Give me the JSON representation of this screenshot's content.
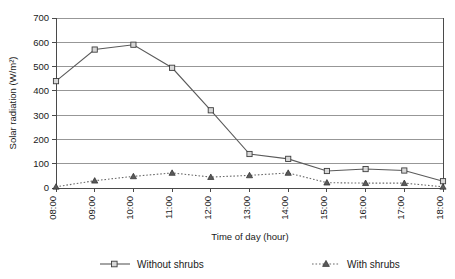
{
  "chart_data": {
    "type": "line",
    "title": "",
    "xlabel": "Time of day (hour)",
    "ylabel": "Solar radiation (W/m²)",
    "categories": [
      "08:00",
      "09:00",
      "10:00",
      "11:00",
      "12:00",
      "13:00",
      "14:00",
      "15:00",
      "16:00",
      "17:00",
      "18:00"
    ],
    "series": [
      {
        "name": "Without shrubs",
        "marker": "square",
        "line_style": "solid",
        "values": [
          440,
          570,
          590,
          495,
          320,
          140,
          120,
          70,
          78,
          72,
          28
        ]
      },
      {
        "name": "With shrubs",
        "marker": "triangle",
        "line_style": "dotted",
        "values": [
          5,
          30,
          48,
          62,
          45,
          52,
          62,
          22,
          20,
          20,
          5
        ]
      }
    ],
    "ylim": [
      0,
      700
    ],
    "y_ticks": [
      0,
      100,
      200,
      300,
      400,
      500,
      600,
      700
    ],
    "y_tick_labels": [
      "0",
      "100",
      "200",
      "300",
      "400",
      "500",
      "600",
      "700"
    ],
    "grid": "horizontal",
    "legend_position": "bottom",
    "colors": {
      "series_without_shrubs": "#5a5a5a",
      "series_with_shrubs": "#6a6a6a",
      "grid": "#7d7d7d",
      "axis": "#4a4a4a",
      "background": "#ffffff"
    }
  },
  "legend": {
    "items": [
      {
        "label": "Without shrubs"
      },
      {
        "label": "With shrubs"
      }
    ]
  },
  "axes": {
    "y_title": "Solar radiation (W/m²)",
    "x_title": "Time of day (hour)"
  }
}
